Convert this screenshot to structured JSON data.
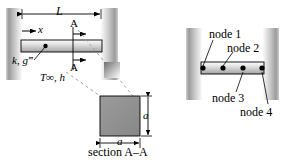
{
  "figure": {
    "type": "engineering-schematic"
  },
  "left_diagram": {
    "name": "bar-between-walls",
    "length_label": "L",
    "axis_label": "x",
    "material_label": "k, g‴",
    "ambient_label": "T∞, h",
    "section_mark_top": "A",
    "section_mark_bottom": "A"
  },
  "section_detail": {
    "caption": "section A–A",
    "width_label": "a",
    "height_label": "a"
  },
  "right_diagram": {
    "name": "node-layout",
    "nodes": [
      {
        "label": "node 1"
      },
      {
        "label": "node 2"
      },
      {
        "label": "node 3"
      },
      {
        "label": "node 4"
      }
    ]
  },
  "colors": {
    "outline": "#000000",
    "wall_light": "#f2f2f2",
    "wall_dark": "#8a8a8a",
    "bar_light": "#f5f5f5",
    "bar_dark": "#a8a8a8",
    "section_fill": "#8f8f8f",
    "leader": "#9a9a9a"
  }
}
